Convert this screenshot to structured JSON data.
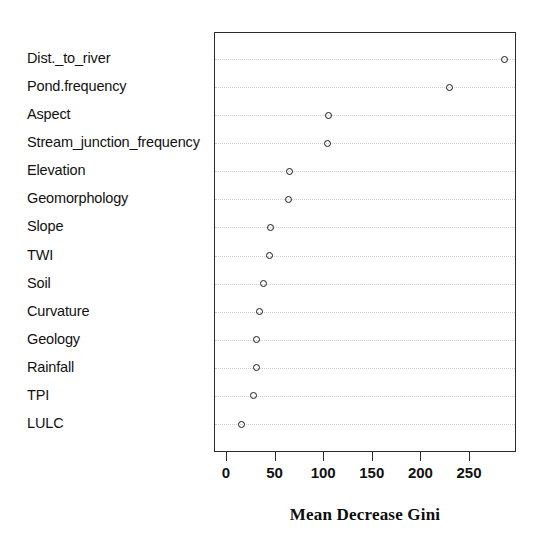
{
  "chart_data": {
    "type": "scatter",
    "title": "",
    "subtitle": "",
    "xlabel": "Mean Decrease Gini",
    "ylabel": "",
    "xlim": [
      0,
      290
    ],
    "ylim": [
      0,
      15
    ],
    "grid": true,
    "legend": null,
    "legend_position": "none",
    "marker": "open-circle",
    "categories": [
      "Dist._to_river",
      "Pond.frequency",
      "Aspect",
      "Stream_junction_frequency",
      "Elevation",
      "Geomorphology",
      "Slope",
      "TWI",
      "Soil",
      "Curvature",
      "Geology",
      "Rainfall",
      "TPI",
      "LULC"
    ],
    "values": [
      286,
      229,
      104,
      103,
      64,
      63,
      45,
      44,
      38,
      33,
      30,
      30,
      27,
      15
    ],
    "xticks": [
      0,
      50,
      100,
      150,
      200,
      250
    ],
    "xtick_labels": [
      "0",
      "50",
      "100",
      "150",
      "200",
      "250"
    ]
  },
  "axis": {
    "x_title": "Mean Decrease Gini"
  }
}
